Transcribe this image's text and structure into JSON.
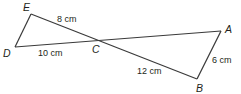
{
  "diagram": {
    "title": "",
    "points": {
      "A": {
        "label": "A",
        "x": 221,
        "y": 31
      },
      "B": {
        "label": "B",
        "x": 197,
        "y": 79
      },
      "C": {
        "label": "C",
        "x": 98,
        "y": 40
      },
      "D": {
        "label": "D",
        "x": 15,
        "y": 47
      },
      "E": {
        "label": "E",
        "x": 31,
        "y": 14
      }
    },
    "measurements": {
      "EC": "8 cm",
      "DC": "10 cm",
      "CB": "12 cm",
      "AB": "6 cm"
    },
    "stroke_color": "#3a3a3a",
    "text_color": "#231f20"
  }
}
